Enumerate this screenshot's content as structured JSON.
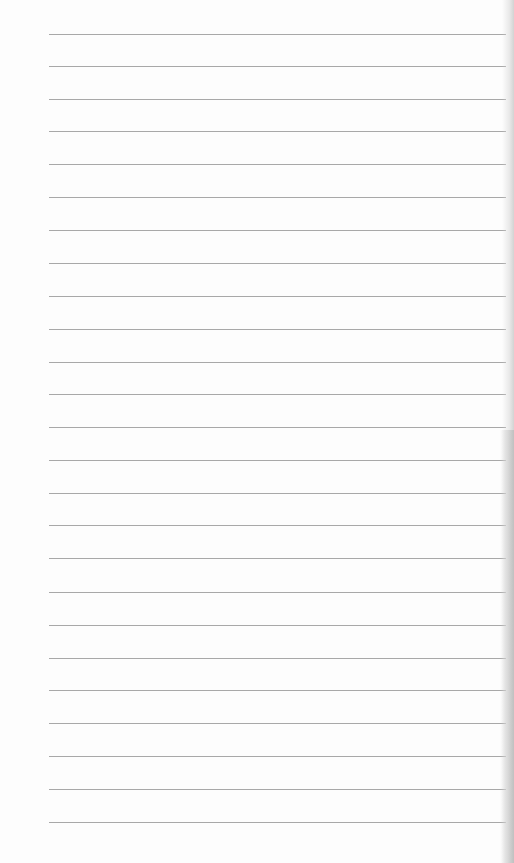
{
  "document": {
    "type": "lined-paper",
    "background_color": "#fdfdfd",
    "rule_color": "#a8a8a8",
    "rule_left": 49,
    "rule_width": 457,
    "rules_y": [
      34,
      66,
      99,
      131,
      164,
      197,
      230,
      263,
      296,
      329,
      362,
      394,
      427,
      460,
      493,
      525,
      558,
      592,
      625,
      658,
      690,
      723,
      756,
      789,
      822
    ]
  }
}
